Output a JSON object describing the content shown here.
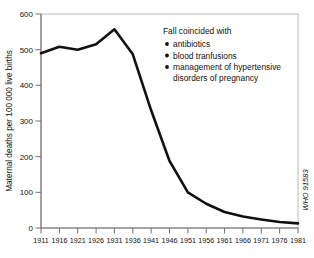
{
  "chart_data": {
    "type": "line",
    "title": "",
    "xlabel": "",
    "ylabel": "Maternal deaths per 100 000 live births",
    "xlim": [
      1911,
      1981
    ],
    "ylim": [
      0,
      600
    ],
    "grid": false,
    "legend_position": "none",
    "x": [
      1911,
      1916,
      1921,
      1926,
      1931,
      1936,
      1941,
      1946,
      1951,
      1956,
      1961,
      1966,
      1971,
      1976,
      1981
    ],
    "values": [
      490,
      508,
      500,
      515,
      557,
      487,
      330,
      188,
      100,
      68,
      45,
      32,
      24,
      17,
      13
    ],
    "series": [
      {
        "name": "Maternal mortality",
        "values": [
          490,
          508,
          500,
          515,
          557,
          487,
          330,
          188,
          100,
          68,
          45,
          32,
          24,
          17,
          13
        ]
      }
    ],
    "x_tick_labels": [
      "1911",
      "1916",
      "1921",
      "1926",
      "1931",
      "1936",
      "1941",
      "1946",
      "1951",
      "1956",
      "1961",
      "1966",
      "1971",
      "1976",
      "1981"
    ],
    "y_tick_labels": [
      "0",
      "100",
      "200",
      "300",
      "400",
      "500",
      "600"
    ],
    "y_ticks": [
      0,
      100,
      200,
      300,
      400,
      500,
      600
    ],
    "line_color": "#111111",
    "annotations": {
      "heading": "Fall coincided with",
      "bullets": [
        "antibiotics",
        "blood tranfusions",
        "management of hypertensive",
        "disorders of pregnancy"
      ]
    },
    "credit": "WHO 91583"
  }
}
